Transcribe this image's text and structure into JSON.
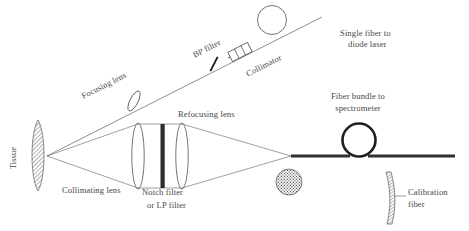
{
  "figure": {
    "background_color": "#ffffff",
    "line_color": "#5d6063",
    "text_color": "#46484a",
    "dark_element_color": "#2b2b2b"
  },
  "labels": {
    "tissue": "Tissue",
    "focusing_lens": "Focusing lens",
    "bp_filter": "BP filter",
    "collimator": "Collimator",
    "single_fiber_line1": "Single fiber to",
    "single_fiber_line2": "diode laser",
    "collimating_lens": "Collimating lens",
    "notch_filter_line1": "Notch filter",
    "notch_filter_line2": "or LP filter",
    "refocusing_lens": "Refocusing lens",
    "fiber_bundle_line1": "Fiber bundle to",
    "fiber_bundle_line2": "spectrometer",
    "calibration_line1": "Calibration",
    "calibration_line2": "fiber"
  },
  "components": {
    "tissue_sample": "hatched-crescent-shape",
    "focusing_lens_icon": "tilted-ellipse-lens",
    "bp_filter_icon": "perpendicular-tick-filter",
    "collimator_icon": "rotated-rectangle-barrel",
    "excitation_fiber_loop_icon": "thin-circle-loop",
    "collimating_lens_icon": "vertical-ellipse-lens",
    "notch_filter_icon": "thick-vertical-bar",
    "refocusing_lens_icon": "vertical-ellipse-lens",
    "fiber_bundle_cross_section_icon": "stippled-filled-circle",
    "fiber_bundle_loop_icon": "thick-circle-loop",
    "calibration_fiber_icon": "curved-hatched-strip",
    "beam_path": "diverging-and-converging-rays"
  }
}
